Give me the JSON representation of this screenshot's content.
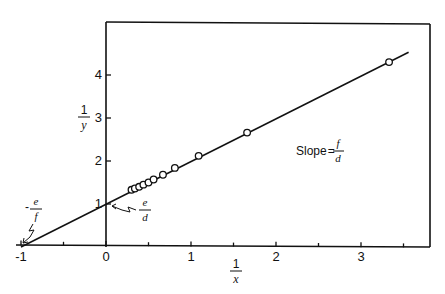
{
  "chart_data": {
    "type": "scatter",
    "title": "",
    "xlabel": "1/x",
    "ylabel": "1/y",
    "xlim": [
      -1,
      3.6
    ],
    "ylim": [
      0,
      5
    ],
    "x_ticks": [
      -1,
      0,
      1,
      2,
      3
    ],
    "x_tick_labels": [
      "-1",
      "0",
      "1",
      "2",
      "3"
    ],
    "x_minor_ticks": [
      -0.5,
      0.5,
      1.5,
      2.5,
      3.5
    ],
    "y_ticks": [
      1,
      2,
      3,
      4
    ],
    "y_tick_labels": [
      "1",
      "2",
      "3",
      "4"
    ],
    "grid": false,
    "series": [
      {
        "name": "data",
        "marker": "open-circle",
        "points": [
          {
            "x": 0.3,
            "y": 1.33
          },
          {
            "x": 0.34,
            "y": 1.36
          },
          {
            "x": 0.39,
            "y": 1.4
          },
          {
            "x": 0.44,
            "y": 1.45
          },
          {
            "x": 0.5,
            "y": 1.5
          },
          {
            "x": 0.56,
            "y": 1.57
          },
          {
            "x": 0.67,
            "y": 1.68
          },
          {
            "x": 0.81,
            "y": 1.84
          },
          {
            "x": 1.09,
            "y": 2.12
          },
          {
            "x": 1.66,
            "y": 2.66
          },
          {
            "x": 3.33,
            "y": 4.3
          }
        ]
      },
      {
        "name": "fit line",
        "style": "line",
        "points": [
          {
            "x": -1,
            "y": 0
          },
          {
            "x": 3.56,
            "y": 4.53
          }
        ]
      }
    ],
    "annotations": [
      {
        "text": "Slope = f/d",
        "num": "f",
        "den": "d",
        "prefix": "Slope ="
      },
      {
        "text": "e/d",
        "num": "e",
        "den": "d",
        "note": "y-intercept"
      },
      {
        "text": "-e/f",
        "num": "e",
        "den": "f",
        "prefix": "-",
        "note": "x-intercept"
      }
    ]
  },
  "labels": {
    "xlabel_num": "1",
    "xlabel_den": "x",
    "ylabel_num": "1",
    "ylabel_den": "y",
    "slope_prefix": "Slope",
    "slope_eq": "=",
    "slope_num": "f",
    "slope_den": "d",
    "yint_num": "e",
    "yint_den": "d",
    "xint_minus": "-",
    "xint_num": "e",
    "xint_den": "f"
  }
}
